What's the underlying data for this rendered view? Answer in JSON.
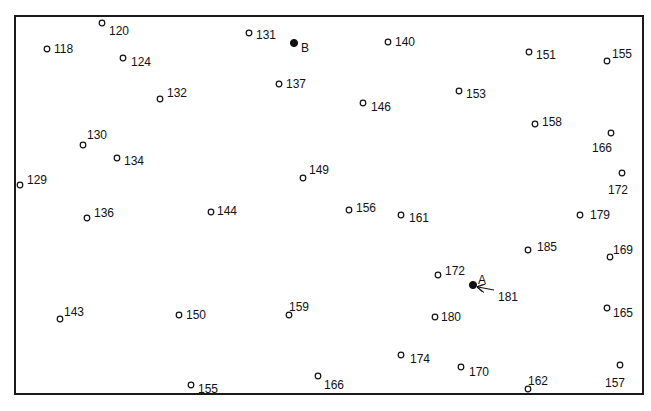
{
  "diagram": {
    "title": "",
    "frame": {
      "x": 14,
      "y": 15,
      "width": 628,
      "height": 378
    },
    "marked_points": [
      {
        "id": "B",
        "label": "B",
        "x": 294,
        "y": 43,
        "lx": 301,
        "ly": 48,
        "filled": true
      },
      {
        "id": "A",
        "label": "A",
        "x": 473,
        "y": 285,
        "lx": 478,
        "ly": 280,
        "filled": true,
        "value_label": "181",
        "arrow_to_value": true,
        "vx": 498,
        "vy": 297
      }
    ],
    "points": [
      {
        "v": "120",
        "x": 102,
        "y": 23,
        "lx": 109,
        "ly": 31
      },
      {
        "v": "118",
        "x": 47,
        "y": 49,
        "lx": 54,
        "ly": 49
      },
      {
        "v": "124",
        "x": 123,
        "y": 58,
        "lx": 131,
        "ly": 62
      },
      {
        "v": "131",
        "x": 249,
        "y": 33,
        "lx": 256,
        "ly": 35
      },
      {
        "v": "140",
        "x": 388,
        "y": 42,
        "lx": 395,
        "ly": 42
      },
      {
        "v": "151",
        "x": 529,
        "y": 52,
        "lx": 536,
        "ly": 55
      },
      {
        "v": "155",
        "x": 607,
        "y": 61,
        "lx": 612,
        "ly": 54
      },
      {
        "v": "132",
        "x": 160,
        "y": 99,
        "lx": 167,
        "ly": 93
      },
      {
        "v": "137",
        "x": 279,
        "y": 84,
        "lx": 286,
        "ly": 84
      },
      {
        "v": "146",
        "x": 363,
        "y": 103,
        "lx": 371,
        "ly": 107
      },
      {
        "v": "153",
        "x": 459,
        "y": 91,
        "lx": 466,
        "ly": 94
      },
      {
        "v": "158",
        "x": 535,
        "y": 124,
        "lx": 542,
        "ly": 122
      },
      {
        "v": "166",
        "x": 611,
        "y": 133,
        "lx": 592,
        "ly": 148
      },
      {
        "v": "130",
        "x": 83,
        "y": 145,
        "lx": 87,
        "ly": 135
      },
      {
        "v": "134",
        "x": 117,
        "y": 158,
        "lx": 124,
        "ly": 161
      },
      {
        "v": "129",
        "x": 20,
        "y": 185,
        "lx": 27,
        "ly": 180
      },
      {
        "v": "149",
        "x": 303,
        "y": 178,
        "lx": 309,
        "ly": 170
      },
      {
        "v": "172",
        "x": 622,
        "y": 173,
        "lx": 608,
        "ly": 190
      },
      {
        "v": "136",
        "x": 87,
        "y": 218,
        "lx": 94,
        "ly": 213
      },
      {
        "v": "144",
        "x": 211,
        "y": 212,
        "lx": 217,
        "ly": 211
      },
      {
        "v": "156",
        "x": 349,
        "y": 210,
        "lx": 356,
        "ly": 208
      },
      {
        "v": "161",
        "x": 401,
        "y": 215,
        "lx": 409,
        "ly": 218
      },
      {
        "v": "179",
        "x": 580,
        "y": 215,
        "lx": 590,
        "ly": 215
      },
      {
        "v": "185",
        "x": 528,
        "y": 250,
        "lx": 537,
        "ly": 247
      },
      {
        "v": "169",
        "x": 610,
        "y": 257,
        "lx": 613,
        "ly": 250
      },
      {
        "v": "172",
        "x": 438,
        "y": 275,
        "lx": 445,
        "ly": 271
      },
      {
        "v": "143",
        "x": 60,
        "y": 319,
        "lx": 64,
        "ly": 312
      },
      {
        "v": "150",
        "x": 179,
        "y": 315,
        "lx": 186,
        "ly": 315
      },
      {
        "v": "159",
        "x": 289,
        "y": 315,
        "lx": 289,
        "ly": 307
      },
      {
        "v": "180",
        "x": 435,
        "y": 317,
        "lx": 441,
        "ly": 317
      },
      {
        "v": "165",
        "x": 607,
        "y": 308,
        "lx": 613,
        "ly": 313
      },
      {
        "v": "174",
        "x": 401,
        "y": 355,
        "lx": 410,
        "ly": 359
      },
      {
        "v": "170",
        "x": 461,
        "y": 367,
        "lx": 469,
        "ly": 372
      },
      {
        "v": "166",
        "x": 318,
        "y": 376,
        "lx": 324,
        "ly": 385
      },
      {
        "v": "155",
        "x": 191,
        "y": 385,
        "lx": 198,
        "ly": 389
      },
      {
        "v": "162",
        "x": 528,
        "y": 389,
        "lx": 528,
        "ly": 381
      },
      {
        "v": "157",
        "x": 620,
        "y": 365,
        "lx": 605,
        "ly": 383
      }
    ]
  }
}
